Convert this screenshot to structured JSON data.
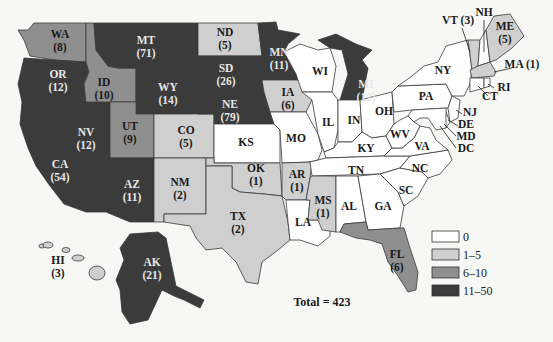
{
  "map": {
    "type": "choropleth",
    "region": "United States",
    "total_label": "Total = 423",
    "legend": [
      {
        "label": "0",
        "color": "#ffffff"
      },
      {
        "label": "1–5",
        "color": "#cfcfcf"
      },
      {
        "label": "6–10",
        "color": "#8f8f8f"
      },
      {
        "label": "11–50",
        "color": "#3b3b3b"
      }
    ],
    "states": {
      "WA": {
        "abbr": "WA",
        "value": "(8)"
      },
      "OR": {
        "abbr": "OR",
        "value": "(12)"
      },
      "CA": {
        "abbr": "CA",
        "value": "(54)"
      },
      "NV": {
        "abbr": "NV",
        "value": "(12)"
      },
      "ID": {
        "abbr": "ID",
        "value": "(10)"
      },
      "MT": {
        "abbr": "MT",
        "value": "(71)"
      },
      "WY": {
        "abbr": "WY",
        "value": "(14)"
      },
      "UT": {
        "abbr": "UT",
        "value": "(9)"
      },
      "AZ": {
        "abbr": "AZ",
        "value": "(11)"
      },
      "CO": {
        "abbr": "CO",
        "value": "(5)"
      },
      "NM": {
        "abbr": "NM",
        "value": "(2)"
      },
      "ND": {
        "abbr": "ND",
        "value": "(5)"
      },
      "SD": {
        "abbr": "SD",
        "value": "(26)"
      },
      "NE": {
        "abbr": "NE",
        "value": "(79)"
      },
      "KS": {
        "abbr": "KS",
        "value": ""
      },
      "OK": {
        "abbr": "OK",
        "value": "(1)"
      },
      "TX": {
        "abbr": "TX",
        "value": "(2)"
      },
      "MN": {
        "abbr": "MN",
        "value": "(11)"
      },
      "IA": {
        "abbr": "IA",
        "value": "(6)"
      },
      "MO": {
        "abbr": "MO",
        "value": ""
      },
      "AR": {
        "abbr": "AR",
        "value": "(1)"
      },
      "LA": {
        "abbr": "LA",
        "value": ""
      },
      "WI": {
        "abbr": "WI",
        "value": ""
      },
      "IL": {
        "abbr": "IL",
        "value": ""
      },
      "MI": {
        "abbr": "MI",
        "value": "(12)"
      },
      "IN": {
        "abbr": "IN",
        "value": ""
      },
      "OH": {
        "abbr": "OH",
        "value": ""
      },
      "KY": {
        "abbr": "KY",
        "value": ""
      },
      "TN": {
        "abbr": "TN",
        "value": ""
      },
      "MS": {
        "abbr": "MS",
        "value": "(1)"
      },
      "AL": {
        "abbr": "AL",
        "value": ""
      },
      "GA": {
        "abbr": "GA",
        "value": ""
      },
      "FL": {
        "abbr": "FL",
        "value": "(6)"
      },
      "SC": {
        "abbr": "SC",
        "value": ""
      },
      "NC": {
        "abbr": "NC",
        "value": ""
      },
      "VA": {
        "abbr": "VA",
        "value": ""
      },
      "WV": {
        "abbr": "WV",
        "value": ""
      },
      "PA": {
        "abbr": "PA",
        "value": ""
      },
      "NY": {
        "abbr": "NY",
        "value": ""
      },
      "VT": {
        "abbr": "VT (3)",
        "value": ""
      },
      "NH": {
        "abbr": "NH",
        "value": ""
      },
      "ME": {
        "abbr": "ME",
        "value": "(5)"
      },
      "MA": {
        "abbr": "MA (1)",
        "value": ""
      },
      "RI": {
        "abbr": "RI",
        "value": ""
      },
      "CT": {
        "abbr": "CT",
        "value": ""
      },
      "NJ": {
        "abbr": "NJ",
        "value": ""
      },
      "DE": {
        "abbr": "DE",
        "value": ""
      },
      "MD": {
        "abbr": "MD",
        "value": ""
      },
      "DC": {
        "abbr": "DC",
        "value": ""
      },
      "AK": {
        "abbr": "AK",
        "value": "(21)"
      },
      "HI": {
        "abbr": "HI",
        "value": "(3)"
      }
    }
  }
}
